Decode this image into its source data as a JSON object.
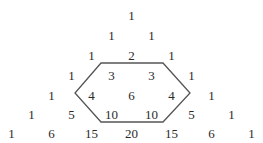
{
  "triangle": {
    "center_x": 131.5,
    "row_y": [
      15,
      35,
      55,
      75,
      95,
      114,
      133
    ],
    "col_spacing": 40,
    "rows": [
      [
        1
      ],
      [
        1,
        1
      ],
      [
        1,
        2,
        1
      ],
      [
        1,
        3,
        3,
        1
      ],
      [
        1,
        4,
        6,
        4,
        1
      ],
      [
        1,
        5,
        10,
        10,
        5,
        1
      ],
      [
        1,
        6,
        15,
        20,
        15,
        6,
        1
      ]
    ]
  },
  "hexagon": {
    "stroke": "#555555",
    "stroke_width": 1.3,
    "points": [
      [
        101,
        63
      ],
      [
        163,
        63
      ],
      [
        190,
        93
      ],
      [
        163,
        122
      ],
      [
        101,
        122
      ],
      [
        75,
        93
      ]
    ],
    "enclosed_values": [
      3,
      3,
      4,
      6,
      4,
      10,
      10
    ]
  },
  "colors": {
    "text": "#2a2a2a",
    "background": "#ffffff"
  }
}
